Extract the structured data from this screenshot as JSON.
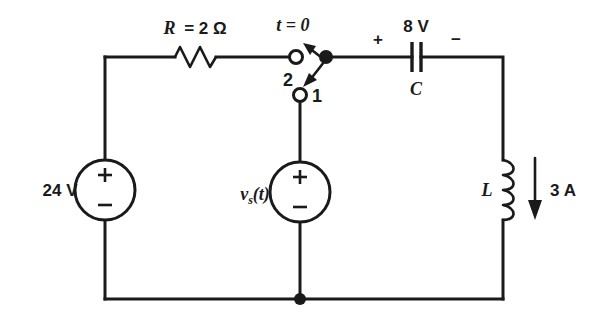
{
  "figure": {
    "kind": "circuit-schematic",
    "width": 599,
    "height": 321,
    "ink_color": "#1a1a1a",
    "background_color": "#ffffff"
  },
  "components": {
    "resistor": {
      "name": "resistor",
      "label": "R = 2 Ω",
      "symbol": "R",
      "value_text": "2 Ω"
    },
    "switch": {
      "name": "spdt-switch",
      "time_label": "t = 0",
      "terminal_upper_label": "2",
      "terminal_lower_label": "1"
    },
    "capacitor": {
      "name": "capacitor",
      "label": "C",
      "voltage_label": "8 V",
      "plus_sign": "+",
      "minus_sign": "−"
    },
    "source_left": {
      "name": "dc-voltage-source",
      "label": "24 V",
      "plus_sign": "+",
      "minus_sign": "−"
    },
    "source_middle": {
      "name": "time-varying-voltage-source",
      "label_main": "v",
      "label_sub": "s",
      "label_arg": "(t)",
      "plus_sign": "+",
      "minus_sign": "−"
    },
    "inductor": {
      "name": "inductor",
      "label": "L",
      "current_label": "3 A",
      "current_direction": "down"
    }
  }
}
